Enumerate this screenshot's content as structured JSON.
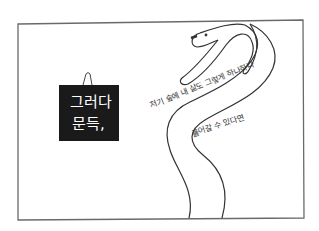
{
  "panel": {
    "border_color": "#555555",
    "background": "#ffffff"
  },
  "sign": {
    "line1": "그러다",
    "line2": "문득,",
    "background": "#1a1a1a",
    "text_color": "#ffffff"
  },
  "snake_text": {
    "outer": "저기 숲에 내 삶도 그렇게 하나하나",
    "inner": "풀어갈 수 있다면"
  }
}
